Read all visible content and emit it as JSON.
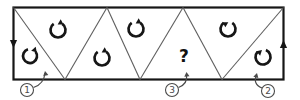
{
  "diagram": {
    "colors": {
      "background": "#ffffff",
      "border": "#161616",
      "diagonal": "#5e5e5e",
      "symbol": "#161616",
      "callout": "#4a4a4a",
      "question": "#111111"
    },
    "frame": {
      "x": 13.5,
      "y": 7.5,
      "width": 270,
      "height": 72
    },
    "diagonals": [
      {
        "x1": 13.5,
        "y1": 7.5,
        "x2": 65,
        "y2": 79.5
      },
      {
        "x1": 65,
        "y1": 79.5,
        "x2": 107,
        "y2": 7.5
      },
      {
        "x1": 107,
        "y1": 7.5,
        "x2": 140,
        "y2": 79.5
      },
      {
        "x1": 140,
        "y1": 79.5,
        "x2": 183,
        "y2": 7.5
      },
      {
        "x1": 183,
        "y1": 7.5,
        "x2": 222,
        "y2": 79.5
      },
      {
        "x1": 222,
        "y1": 79.5,
        "x2": 283.5,
        "y2": 7.5
      }
    ],
    "edge_arrows": [
      {
        "name": "left-edge-down-arrow",
        "direction": "down",
        "x": 13.5,
        "y": 48
      },
      {
        "name": "right-edge-up-arrow",
        "direction": "up",
        "x": 283.5,
        "y": 40
      }
    ],
    "rotation_symbols": [
      {
        "name": "rotation-symbol-1",
        "cx": 30,
        "cy": 56,
        "r": 7,
        "rotation": 18,
        "tip": "right"
      },
      {
        "name": "rotation-symbol-2",
        "cx": 58,
        "cy": 30,
        "r": 7.5,
        "rotation": 0,
        "tip": "right"
      },
      {
        "name": "rotation-symbol-3",
        "cx": 102,
        "cy": 58,
        "r": 7.5,
        "rotation": 0,
        "tip": "right"
      },
      {
        "name": "rotation-symbol-4",
        "cx": 136,
        "cy": 29,
        "r": 7.5,
        "rotation": 0,
        "tip": "right"
      },
      {
        "name": "rotation-symbol-5",
        "cx": 228,
        "cy": 29,
        "r": 7.5,
        "rotation": 0,
        "tip": "left"
      },
      {
        "name": "rotation-symbol-6",
        "cx": 263,
        "cy": 57,
        "r": 7.5,
        "rotation": -12,
        "tip": "left"
      }
    ],
    "question_mark": {
      "text": "?",
      "x": 184,
      "y": 55
    },
    "callouts": [
      {
        "name": "callout-1",
        "number": "1",
        "cx": 27,
        "cy": 90,
        "r": 6.5,
        "leader": "M 33.5 87.5 Q 44 84 45 73",
        "tip_x": 45,
        "tip_y": 71,
        "tip_angle": -100
      },
      {
        "name": "callout-3",
        "number": "3",
        "cx": 172,
        "cy": 90,
        "r": 6.5,
        "leader": "M 178.5 87.5 Q 188 84 186.5 74",
        "tip_x": 186.5,
        "tip_y": 72,
        "tip_angle": -95
      },
      {
        "name": "callout-2",
        "number": "2",
        "cx": 268,
        "cy": 91,
        "r": 6.5,
        "leader": "M 262 88 Q 252.5 84 256.5 75",
        "tip_x": 257,
        "tip_y": 73,
        "tip_angle": -75
      }
    ]
  }
}
